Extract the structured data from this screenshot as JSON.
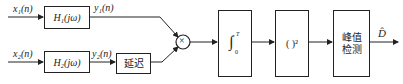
{
  "diagram": {
    "inputs": [
      {
        "label": "x₁(n)"
      },
      {
        "label": "x₂(n)"
      }
    ],
    "filters": [
      {
        "label": "H₁(jω)",
        "output": "y₁(n)"
      },
      {
        "label": "H₂(jω)",
        "output": "y₂(n)"
      }
    ],
    "delay_block": {
      "label": "延迟"
    },
    "multiplier": {
      "symbol": "×"
    },
    "integrator": {
      "symbol": "∫",
      "upper": "T",
      "lower": "0"
    },
    "square_block": {
      "label": "( )²"
    },
    "peak_block": {
      "line1": "峰值",
      "line2": "检测"
    },
    "output": {
      "label": "D̂"
    },
    "colors": {
      "stroke": "#222222",
      "background": "#ffffff"
    }
  }
}
